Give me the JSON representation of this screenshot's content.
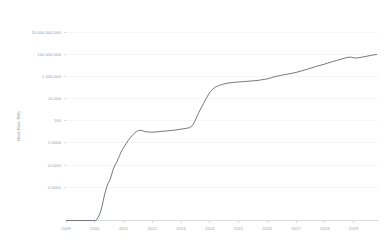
{
  "chart_data": {
    "type": "line",
    "title": "",
    "xlabel": "",
    "ylabel": "Hash Rate TH/s",
    "yscale": "log",
    "grid": true,
    "legend": "none",
    "line_color": "#5b5f63",
    "grid_color": "#eceef0",
    "tick_color": "#9a9ea3",
    "background": "#ffffff",
    "xlim": [
      2009.0,
      2019.85
    ],
    "ylim": [
      1e-07,
      100000000000
    ],
    "y_ticks": [
      "10,000,000,000",
      "100,000,000",
      "1,000,000",
      "10,000",
      "100",
      "1.0000",
      "0.0100",
      "0.0001"
    ],
    "y_tick_values": [
      10000000000,
      100000000,
      1000000,
      10000,
      100,
      1.0,
      0.01,
      0.0001
    ],
    "x_ticks": [
      "2009",
      "2010",
      "2011",
      "2012",
      "2013",
      "2014",
      "2015",
      "2016",
      "2017",
      "2018",
      "2019"
    ],
    "x_tick_values": [
      2009,
      2010,
      2011,
      2012,
      2013,
      2014,
      2015,
      2016,
      2017,
      2018,
      2019
    ],
    "series": [
      {
        "name": "Hash Rate",
        "x": [
          2009.02,
          2009.12,
          2009.22,
          2009.32,
          2009.42,
          2009.52,
          2009.62,
          2009.72,
          2009.82,
          2009.92,
          2010.02,
          2010.08,
          2010.14,
          2010.2,
          2010.26,
          2010.3,
          2010.34,
          2010.38,
          2010.42,
          2010.46,
          2010.5,
          2010.54,
          2010.58,
          2010.62,
          2010.66,
          2010.7,
          2010.74,
          2010.78,
          2010.82,
          2010.86,
          2010.9,
          2010.94,
          2010.98,
          2011.04,
          2011.1,
          2011.16,
          2011.22,
          2011.28,
          2011.34,
          2011.4,
          2011.46,
          2011.52,
          2011.58,
          2011.64,
          2011.7,
          2011.76,
          2011.82,
          2011.88,
          2011.94,
          2012.0,
          2012.1,
          2012.2,
          2012.3,
          2012.4,
          2012.5,
          2012.6,
          2012.7,
          2012.8,
          2012.9,
          2013.0,
          2013.1,
          2013.2,
          2013.3,
          2013.36,
          2013.42,
          2013.48,
          2013.54,
          2013.6,
          2013.66,
          2013.72,
          2013.78,
          2013.84,
          2013.9,
          2013.96,
          2014.02,
          2014.1,
          2014.18,
          2014.26,
          2014.34,
          2014.42,
          2014.5,
          2014.6,
          2014.7,
          2014.8,
          2014.9,
          2015.0,
          2015.1,
          2015.2,
          2015.3,
          2015.4,
          2015.5,
          2015.6,
          2015.7,
          2015.8,
          2015.9,
          2016.0,
          2016.1,
          2016.2,
          2016.3,
          2016.4,
          2016.5,
          2016.6,
          2016.7,
          2016.8,
          2016.9,
          2017.0,
          2017.1,
          2017.2,
          2017.3,
          2017.4,
          2017.5,
          2017.6,
          2017.7,
          2017.8,
          2017.9,
          2018.0,
          2018.1,
          2018.2,
          2018.3,
          2018.4,
          2018.5,
          2018.6,
          2018.7,
          2018.8,
          2018.9,
          2019.0,
          2019.1,
          2019.2,
          2019.3,
          2019.4,
          2019.5,
          2019.6,
          2019.7,
          2019.8
        ],
        "values": [
          1e-07,
          1e-07,
          1e-07,
          1e-07,
          1e-07,
          1e-07,
          1e-07,
          1e-07,
          1e-07,
          1e-07,
          1e-07,
          1.3e-07,
          2.5e-07,
          6e-07,
          2.2e-06,
          7e-06,
          2e-05,
          5e-05,
          0.00011,
          0.00022,
          0.00032,
          0.00055,
          0.0012,
          0.0028,
          0.0055,
          0.009,
          0.014,
          0.022,
          0.04,
          0.07,
          0.12,
          0.2,
          0.3,
          0.55,
          0.95,
          1.6,
          2.6,
          4.0,
          6.0,
          8.5,
          11.0,
          13.0,
          14.0,
          13.0,
          11.5,
          10.5,
          10.0,
          9.6,
          9.4,
          9.3,
          9.6,
          10.2,
          10.8,
          11.5,
          12.0,
          12.8,
          13.5,
          14.5,
          16.0,
          17.5,
          19.0,
          21.0,
          24.0,
          30.0,
          45.0,
          90.0,
          200.0,
          450.0,
          900.0,
          1800.0,
          3500.0,
          7000.0,
          13000.0,
          25000.0,
          42000.0,
          70000.0,
          100000.0,
          130000.0,
          160000.0,
          185000.0,
          210000.0,
          240000.0,
          265000.0,
          285000.0,
          300000.0,
          315000.0,
          330000.0,
          345000.0,
          360000.0,
          380000.0,
          400000.0,
          420000.0,
          450000.0,
          490000.0,
          540000.0,
          600000.0,
          700000.0,
          850000.0,
          1000000.0,
          1150000.0,
          1300000.0,
          1450000.0,
          1600000.0,
          1800000.0,
          2000000.0,
          2300000.0,
          2700000.0,
          3200000.0,
          3800000.0,
          4500000.0,
          5500000.0,
          6500000.0,
          8000000.0,
          9500000.0,
          11000000.0,
          13000000.0,
          16000000.0,
          19000000.0,
          23000000.0,
          27000000.0,
          32000000.0,
          38000000.0,
          45000000.0,
          52000000.0,
          55000000.0,
          48000000.0,
          46000000.0,
          50000000.0,
          55000000.0,
          62000000.0,
          70000000.0,
          78000000.0,
          88000000.0,
          95000000.0
        ]
      }
    ]
  }
}
